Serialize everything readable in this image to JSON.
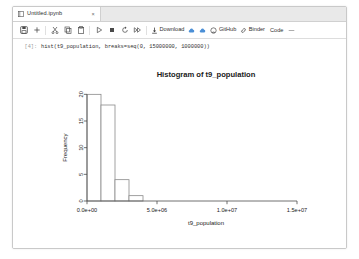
{
  "window": {
    "tab": {
      "title": "Untitled.ipynb",
      "icon": "notebook-icon",
      "close_label": "×"
    }
  },
  "toolbar": {
    "buttons": [
      {
        "name": "save-icon",
        "label": ""
      },
      {
        "name": "add-cell-icon",
        "label": ""
      },
      {
        "name": "cut-icon",
        "label": ""
      },
      {
        "name": "copy-icon",
        "label": ""
      },
      {
        "name": "paste-icon",
        "label": ""
      },
      {
        "name": "run-icon",
        "label": ""
      },
      {
        "name": "stop-icon",
        "label": ""
      },
      {
        "name": "restart-icon",
        "label": ""
      },
      {
        "name": "restart-run-all-icon",
        "label": ""
      }
    ],
    "download_label": "Download",
    "cloud_up_label": "",
    "cloud_down_label": "",
    "github_label": "GitHub",
    "binder_label": "Binder",
    "celltype_value": "Code",
    "caret_glyph": "⌄"
  },
  "cell": {
    "prompt": "[4]:",
    "code": "hist(t9_population, breaks=seq(0, 15000000, 1000000))"
  },
  "colors": {
    "tab_bar": "#e9e9e9",
    "window_border": "#c9c9c9",
    "cloud_blue": "#4b8fd6",
    "plot_line": "#4d4d4d",
    "bar_stroke": "#8a8a8a"
  },
  "chart_data": {
    "type": "bar",
    "title": "Histogram of t9_population",
    "xlabel": "t9_population",
    "ylabel": "Frequency",
    "xlim": [
      0,
      17000000
    ],
    "ylim": [
      0,
      21
    ],
    "grid": false,
    "legend": null,
    "bin_width": 1000000,
    "bin_edges": [
      0,
      1000000,
      2000000,
      3000000,
      4000000,
      5000000,
      6000000,
      7000000,
      8000000,
      9000000,
      10000000,
      11000000,
      12000000,
      13000000,
      14000000,
      15000000
    ],
    "values": [
      20,
      18,
      4,
      1,
      0,
      0,
      0,
      0,
      0,
      0,
      0,
      0,
      0,
      0,
      0
    ],
    "xticks": [
      {
        "value": 0,
        "label": "0.0e+00"
      },
      {
        "value": 5000000,
        "label": "5.0e+06"
      },
      {
        "value": 10000000,
        "label": "1.0e+07"
      },
      {
        "value": 15000000,
        "label": "1.5e+07"
      }
    ],
    "yticks": [
      {
        "value": 0,
        "label": "0"
      },
      {
        "value": 5,
        "label": "5"
      },
      {
        "value": 10,
        "label": "10"
      },
      {
        "value": 15,
        "label": "15"
      },
      {
        "value": 20,
        "label": "20"
      }
    ]
  }
}
